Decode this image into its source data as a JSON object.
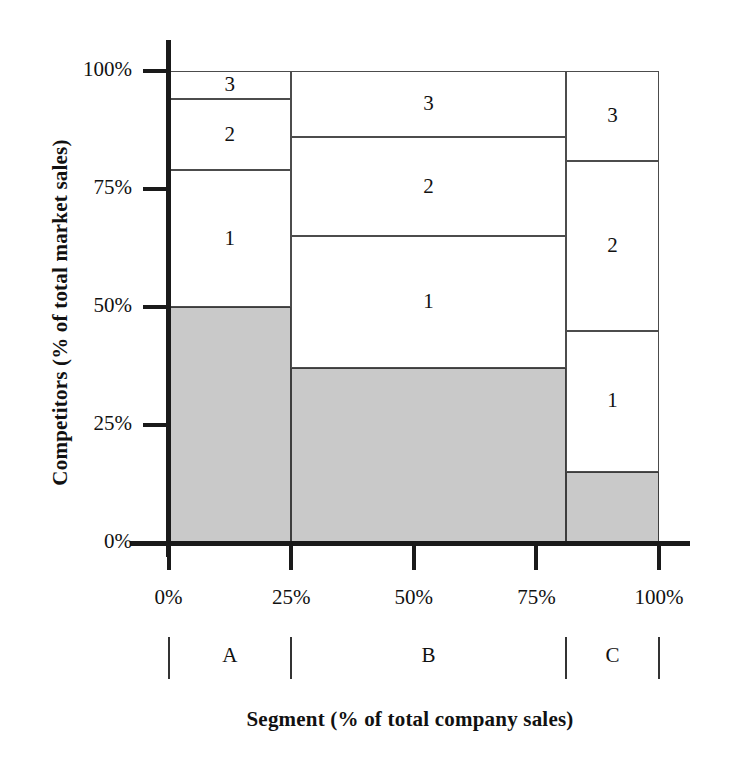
{
  "chart_data": {
    "type": "bar",
    "title": "",
    "subtitle": "",
    "xlabel": "Segment (% of total company sales)",
    "ylabel": "Competitors (% of total market sales)",
    "xlim": [
      0,
      100
    ],
    "ylim": [
      0,
      100
    ],
    "grid": false,
    "legend": "none",
    "x_tick_labels": [
      "0%",
      "25%",
      "50%",
      "75%",
      "100%"
    ],
    "x_tick_values": [
      0,
      25,
      50,
      75,
      100
    ],
    "y_tick_labels": [
      "0%",
      "25%",
      "50%",
      "75%",
      "100%"
    ],
    "y_tick_values": [
      0,
      25,
      50,
      75,
      100
    ],
    "segment_labels": [
      "A",
      "B",
      "C"
    ],
    "segment_boundaries": [
      0,
      25,
      81,
      100
    ],
    "series": [
      {
        "name": "Company share",
        "shaded": true,
        "values": [
          50,
          37,
          15
        ]
      },
      {
        "name": "1",
        "shaded": false,
        "values": [
          29,
          28,
          30
        ]
      },
      {
        "name": "2",
        "shaded": false,
        "values": [
          15,
          21,
          36
        ]
      },
      {
        "name": "3",
        "shaded": false,
        "values": [
          6,
          14,
          19
        ]
      }
    ],
    "segments": [
      {
        "label": "A",
        "x_start": 0,
        "x_end": 25,
        "blocks": [
          {
            "label": "",
            "shaded": true,
            "y_start": 0,
            "y_end": 50
          },
          {
            "label": "1",
            "shaded": false,
            "y_start": 50,
            "y_end": 79
          },
          {
            "label": "2",
            "shaded": false,
            "y_start": 79,
            "y_end": 94
          },
          {
            "label": "3",
            "shaded": false,
            "y_start": 94,
            "y_end": 100
          }
        ]
      },
      {
        "label": "B",
        "x_start": 25,
        "x_end": 81,
        "blocks": [
          {
            "label": "",
            "shaded": true,
            "y_start": 0,
            "y_end": 37
          },
          {
            "label": "1",
            "shaded": false,
            "y_start": 37,
            "y_end": 65
          },
          {
            "label": "2",
            "shaded": false,
            "y_start": 65,
            "y_end": 86
          },
          {
            "label": "3",
            "shaded": false,
            "y_start": 86,
            "y_end": 100
          }
        ]
      },
      {
        "label": "C",
        "x_start": 81,
        "x_end": 100,
        "blocks": [
          {
            "label": "",
            "shaded": true,
            "y_start": 0,
            "y_end": 15
          },
          {
            "label": "1",
            "shaded": false,
            "y_start": 15,
            "y_end": 45
          },
          {
            "label": "2",
            "shaded": false,
            "y_start": 45,
            "y_end": 81
          },
          {
            "label": "3",
            "shaded": false,
            "y_start": 81,
            "y_end": 100
          }
        ]
      }
    ],
    "colors": {
      "shaded_fill": "#c9c9c9",
      "unshaded_fill": "#ffffff",
      "block_border": "#4c4c4c",
      "axis": "#1a1a1a",
      "text": "#111111"
    }
  }
}
